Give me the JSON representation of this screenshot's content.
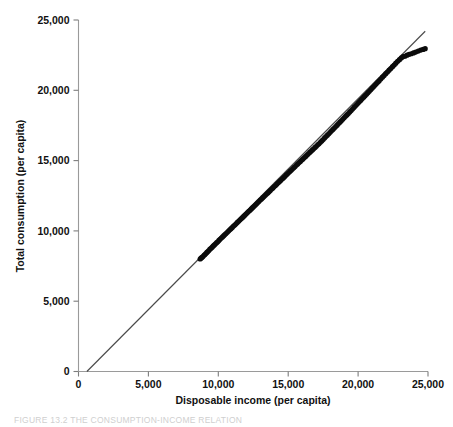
{
  "figure": {
    "caption_prefix": "FIGURE 13.2",
    "caption_title": "THE CONSUMPTION-INCOME RELATION",
    "caption_full": "FIGURE 13.2   THE CONSUMPTION-INCOME RELATION"
  },
  "colors": {
    "background": "#ffffff",
    "marker": "#0b0b0b",
    "reference_line": "#4a4a4a",
    "axis": "#9a9a9a",
    "text": "#111111",
    "caption_text": "#cfcfcf"
  },
  "chart_data": {
    "type": "scatter",
    "title": "",
    "xlabel": "Disposable income (per capita)",
    "ylabel": "Total consumption (per capita)",
    "xlim": [
      0,
      25000
    ],
    "ylim": [
      0,
      25000
    ],
    "xticks": [
      0,
      5000,
      10000,
      15000,
      20000,
      25000
    ],
    "yticks": [
      0,
      5000,
      10000,
      15000,
      20000,
      25000
    ],
    "xticklabels": [
      "0",
      "5,000",
      "10,000",
      "15,000",
      "20,000",
      "25,000"
    ],
    "yticklabels": [
      "0",
      "5,000",
      "10,000",
      "15,000",
      "20,000",
      "25,000"
    ],
    "grid": false,
    "legend": null,
    "annotations": [],
    "reference_line": {
      "name": "45-degree line",
      "x": [
        600,
        24800
      ],
      "y": [
        0,
        24200
      ],
      "description": "Straight fitted/45-degree reference line through the scatter"
    },
    "series": [
      {
        "name": "Consumption vs disposable income",
        "marker": "filled-circle",
        "x": [
          8700,
          8760,
          8830,
          8900,
          8980,
          9040,
          9110,
          9180,
          9250,
          9320,
          9400,
          9480,
          9560,
          9640,
          9720,
          9800,
          9880,
          9960,
          10040,
          10120,
          10210,
          10300,
          10390,
          10470,
          10550,
          10640,
          10730,
          10820,
          10910,
          11000,
          11090,
          11180,
          11270,
          11360,
          11450,
          11540,
          11630,
          11720,
          11810,
          11900,
          12000,
          12090,
          12180,
          12270,
          12360,
          12450,
          12540,
          12630,
          12720,
          12810,
          12900,
          13000,
          13090,
          13180,
          13270,
          13360,
          13450,
          13540,
          13630,
          13720,
          13820,
          13910,
          14000,
          14090,
          14180,
          14280,
          14370,
          14460,
          14560,
          14650,
          14740,
          14840,
          14930,
          15020,
          15120,
          15210,
          15300,
          15400,
          15490,
          15590,
          15680,
          15780,
          15870,
          15970,
          16060,
          16160,
          16250,
          16350,
          16440,
          16540,
          16630,
          16730,
          16820,
          16920,
          17010,
          17110,
          17200,
          17300,
          17400,
          17500,
          17600,
          17700,
          17800,
          17900,
          18000,
          18100,
          18200,
          18300,
          18400,
          18500,
          18600,
          18700,
          18800,
          18900,
          19000,
          19100,
          19200,
          19300,
          19400,
          19500,
          19600,
          19700,
          19800,
          19900,
          20000,
          20100,
          20200,
          20300,
          20400,
          20500,
          20600,
          20700,
          20800,
          20900,
          21000,
          21100,
          21200,
          21300,
          21400,
          21500,
          21620,
          21740,
          21860,
          21980,
          22100,
          22220,
          22340,
          22460,
          22580,
          22700,
          22830,
          22960,
          23090,
          23220,
          23350,
          23500,
          23650,
          23800,
          23960,
          24120,
          24300,
          24480,
          24650,
          24800
        ],
        "y": [
          8000,
          8060,
          8110,
          8180,
          8260,
          8320,
          8390,
          8470,
          8530,
          8600,
          8700,
          8760,
          8840,
          8930,
          9000,
          9080,
          9160,
          9230,
          9320,
          9400,
          9490,
          9570,
          9660,
          9740,
          9810,
          9900,
          9990,
          10080,
          10160,
          10250,
          10340,
          10420,
          10510,
          10600,
          10680,
          10770,
          10860,
          10940,
          11030,
          11120,
          11220,
          11300,
          11390,
          11470,
          11560,
          11650,
          11730,
          11820,
          11910,
          12000,
          12090,
          12190,
          12270,
          12360,
          12440,
          12530,
          12620,
          12700,
          12790,
          12880,
          12980,
          13060,
          13150,
          13230,
          13320,
          13420,
          13500,
          13590,
          13690,
          13770,
          13860,
          13960,
          14040,
          14130,
          14230,
          14310,
          14400,
          14500,
          14580,
          14680,
          14760,
          14860,
          14940,
          15040,
          15120,
          15220,
          15300,
          15400,
          15480,
          15580,
          15660,
          15760,
          15840,
          15940,
          16020,
          16120,
          16200,
          16300,
          16400,
          16500,
          16610,
          16710,
          16810,
          16910,
          17010,
          17120,
          17220,
          17320,
          17420,
          17520,
          17630,
          17730,
          17830,
          17940,
          18040,
          18150,
          18250,
          18350,
          18460,
          18560,
          18670,
          18780,
          18880,
          18990,
          19090,
          19200,
          19300,
          19410,
          19510,
          19620,
          19720,
          19830,
          19930,
          20040,
          20150,
          20250,
          20360,
          20460,
          20570,
          20670,
          20800,
          20930,
          21050,
          21180,
          21300,
          21430,
          21550,
          21680,
          21800,
          21930,
          22060,
          22180,
          22300,
          22400,
          22420,
          22500,
          22560,
          22600,
          22660,
          22720,
          22790,
          22860,
          22910,
          22960
        ],
        "note": "Points lie close to the 45-degree line, slightly below it at low income and slightly above it at high income"
      }
    ]
  }
}
